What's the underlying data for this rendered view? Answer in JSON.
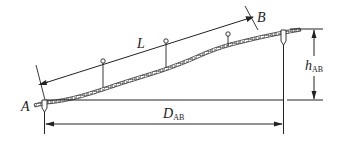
{
  "diagram": {
    "type": "slope-distance-measurement",
    "labels": {
      "point_a": "A",
      "point_b": "B",
      "slope_length": "L",
      "horizontal_distance": "D",
      "horizontal_distance_sub": "AB",
      "height_difference": "h",
      "height_difference_sub": "AB"
    },
    "elements": [
      "ground-profile",
      "slope-line-L",
      "horizontal-distance-D_AB",
      "height-difference-h_AB",
      "stake-A",
      "stake-B",
      "range-poles"
    ],
    "colors": {
      "line": "#222222",
      "background": "#ffffff"
    }
  }
}
